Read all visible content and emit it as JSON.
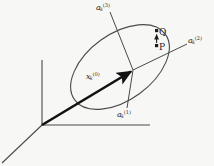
{
  "figure": {
    "background_color": "#f7f7f5",
    "line_color": "#4a4a4a",
    "vector_color": "#111111",
    "text_color": "#2b2b2b",
    "width": 214,
    "height": 166
  },
  "labels": {
    "axis3": {
      "base": "a",
      "sub": "k",
      "sup": "(3)"
    },
    "axis2": {
      "base": "a",
      "sub": "k",
      "sup": "(2)"
    },
    "axis1": {
      "base": "a",
      "sub": "k",
      "sup": "(1)"
    },
    "state_vector": {
      "base": "x",
      "sub": "k",
      "sup": "(0)"
    },
    "point_q": "Q",
    "point_p": "P"
  },
  "geometry": {
    "global_origin": {
      "x": 42,
      "y": 125
    },
    "global_axis_vertical_tip": {
      "x": 42,
      "y": 60
    },
    "global_axis_horizontal_tip": {
      "x": 150,
      "y": 125
    },
    "global_axis_depth_tip": {
      "x": 2,
      "y": 163
    },
    "ellipse": {
      "center": {
        "x": 120,
        "y": 67
      },
      "radius_major": 56,
      "radius_minor": 33,
      "rotation_deg": -36
    },
    "local_frame_center": {
      "x": 133,
      "y": 70
    },
    "local_axis1_tip": {
      "x": 127,
      "y": 108
    },
    "local_axis2_tip": {
      "x": 187,
      "y": 44
    },
    "local_axis3_tip": {
      "x": 110,
      "y": 12
    },
    "point_p": {
      "x": 157,
      "y": 45
    },
    "point_q": {
      "x": 157,
      "y": 31
    },
    "pq_arrow": {
      "from_y": 44,
      "to_y": 33,
      "x": 157
    }
  }
}
